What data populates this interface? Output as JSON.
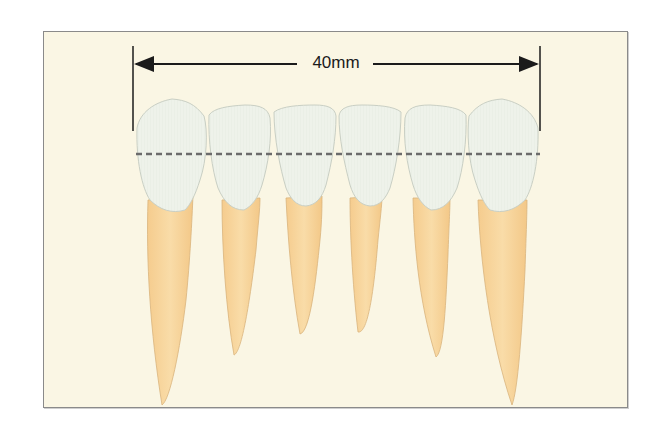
{
  "diagram": {
    "measurement_label": "40mm",
    "colors": {
      "background": "#faf6e4",
      "frame_border": "#8a8a8a",
      "crown_fill": "#eef2ea",
      "crown_stroke": "#c9cfc4",
      "root_fill": "#f7d49a",
      "root_stroke": "#d9b47c",
      "dimension_line": "#1b1b1b",
      "dashed_line": "#6b6b6b"
    },
    "teeth": [
      {
        "name": "tooth-1",
        "position": "left-canine"
      },
      {
        "name": "tooth-2",
        "position": "left-lateral-incisor"
      },
      {
        "name": "tooth-3",
        "position": "left-central-incisor"
      },
      {
        "name": "tooth-4",
        "position": "right-central-incisor"
      },
      {
        "name": "tooth-5",
        "position": "right-lateral-incisor"
      },
      {
        "name": "tooth-6",
        "position": "right-canine"
      }
    ]
  }
}
